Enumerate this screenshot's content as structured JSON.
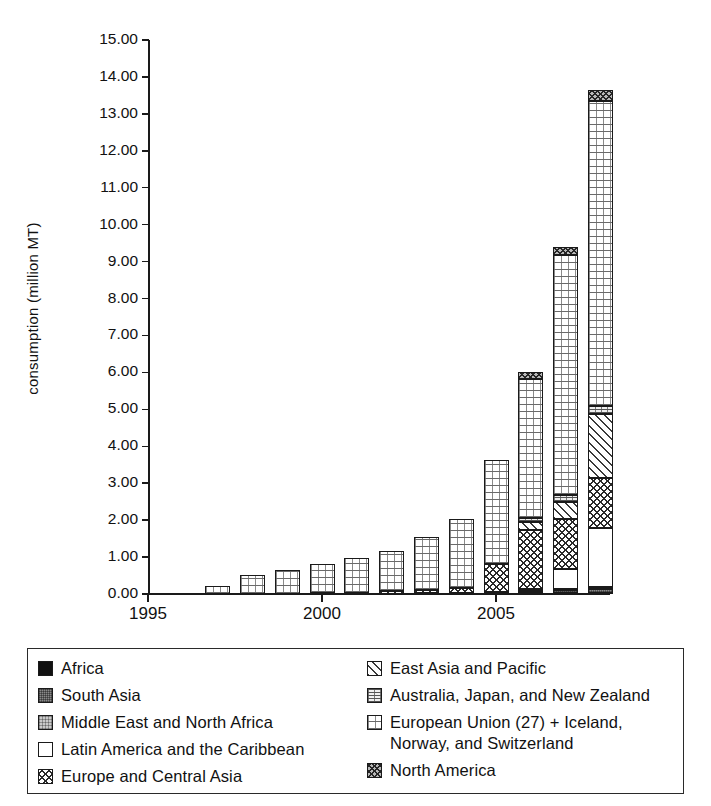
{
  "chart_data": {
    "type": "bar",
    "stacked": true,
    "title": "",
    "xlabel": "",
    "ylabel": "consumption (million MT)",
    "ylim": [
      0,
      15
    ],
    "ytick_labels": [
      "0.00",
      "1.00",
      "2.00",
      "3.00",
      "4.00",
      "5.00",
      "6.00",
      "7.00",
      "8.00",
      "9.00",
      "10.00",
      "11.00",
      "12.00",
      "13.00",
      "14.00",
      "15.00"
    ],
    "ytick_values": [
      0,
      1,
      2,
      3,
      4,
      5,
      6,
      7,
      8,
      9,
      10,
      11,
      12,
      13,
      14,
      15
    ],
    "xtick_labels": [
      "1995",
      "2000",
      "2005"
    ],
    "xtick_values": [
      1995,
      2000,
      2005
    ],
    "x": [
      1996,
      1997,
      1998,
      1999,
      2000,
      2001,
      2002,
      2003,
      2004,
      2005,
      2006,
      2007,
      2008
    ],
    "categories": [
      "1997",
      "1998",
      "1999",
      "2000",
      "2001",
      "2002",
      "2003",
      "2004",
      "2005",
      "2006",
      "2007",
      "2008"
    ],
    "grid": false,
    "legend_position": "below",
    "series": [
      {
        "name": "Africa",
        "pattern": "solid-black",
        "values": [
          0,
          0,
          0,
          0,
          0,
          0,
          0,
          0,
          0,
          0,
          0.02,
          0.03
        ]
      },
      {
        "name": "South Asia",
        "pattern": "dark-gray",
        "values": [
          0,
          0,
          0,
          0,
          0,
          0.01,
          0.02,
          0.03,
          0.04,
          0.05,
          0.08,
          0.1
        ]
      },
      {
        "name": "Middle East and North Africa",
        "pattern": "light-gray",
        "values": [
          0,
          0,
          0,
          0,
          0,
          0,
          0.01,
          0.01,
          0.02,
          0.03,
          0.04,
          0.05
        ]
      },
      {
        "name": "Latin America and the Caribbean",
        "pattern": "white",
        "values": [
          0,
          0,
          0,
          0,
          0,
          0,
          0,
          0,
          0,
          0.05,
          0.55,
          1.6
        ]
      },
      {
        "name": "Europe and Central Asia",
        "pattern": "checker",
        "values": [
          0,
          0,
          0,
          0.02,
          0.04,
          0.06,
          0.08,
          0.12,
          0.75,
          1.6,
          1.35,
          1.35
        ]
      },
      {
        "name": "East Asia and Pacific",
        "pattern": "diagonal-hatch",
        "values": [
          0,
          0,
          0,
          0,
          0,
          0,
          0,
          0,
          0,
          0.22,
          0.45,
          1.75
        ]
      },
      {
        "name": "Australia, Japan, and New Zealand",
        "pattern": "wavy",
        "values": [
          0,
          0,
          0,
          0,
          0,
          0,
          0,
          0,
          0,
          0.12,
          0.18,
          0.22
        ]
      },
      {
        "name": "European Union (27) + Iceland, Norway, and Switzerland",
        "pattern": "dots",
        "values": [
          0.23,
          0.52,
          0.65,
          0.79,
          0.93,
          1.09,
          1.44,
          1.88,
          2.82,
          3.75,
          6.5,
          8.25
        ]
      },
      {
        "name": "North America",
        "pattern": "dense-checker",
        "values": [
          0,
          0,
          0,
          0,
          0,
          0,
          0,
          0,
          0,
          0.2,
          0.22,
          0.3
        ]
      }
    ],
    "totals": [
      0.23,
      0.52,
      0.65,
      0.81,
      0.97,
      1.16,
      1.55,
      2.04,
      3.63,
      6.02,
      9.19,
      13.65
    ]
  },
  "axis": {
    "ylabel": "consumption (million MT)"
  },
  "legend": {
    "left_items": [
      {
        "label": "Africa",
        "pattern": "p-africa",
        "name": "legend-swatch-africa"
      },
      {
        "label": "South Asia",
        "pattern": "p-southasia",
        "name": "legend-swatch-south-asia"
      },
      {
        "label": "Middle East and North Africa",
        "pattern": "p-mena",
        "name": "legend-swatch-middle-east-north-africa"
      },
      {
        "label": "Latin America and the Caribbean",
        "pattern": "p-latam",
        "name": "legend-swatch-latin-america"
      },
      {
        "label": "Europe and Central Asia",
        "pattern": "p-eca",
        "name": "legend-swatch-europe-central-asia"
      }
    ],
    "right_items": [
      {
        "label": "East Asia and Pacific",
        "pattern": "p-eap",
        "name": "legend-swatch-east-asia-pacific"
      },
      {
        "label": "Australia, Japan, and New Zealand",
        "pattern": "p-ajnz",
        "name": "legend-swatch-australia-japan-new-zealand"
      },
      {
        "label": "European Union (27) + Iceland,",
        "label2": "Norway, and Switzerland",
        "pattern": "p-eu",
        "name": "legend-swatch-european-union"
      },
      {
        "label": "North America",
        "pattern": "p-na",
        "name": "legend-swatch-north-america"
      }
    ]
  },
  "colors": {
    "axis": "#1a1a1a",
    "text": "#111111",
    "background": "#ffffff",
    "legend_border": "#2a2a2a"
  }
}
